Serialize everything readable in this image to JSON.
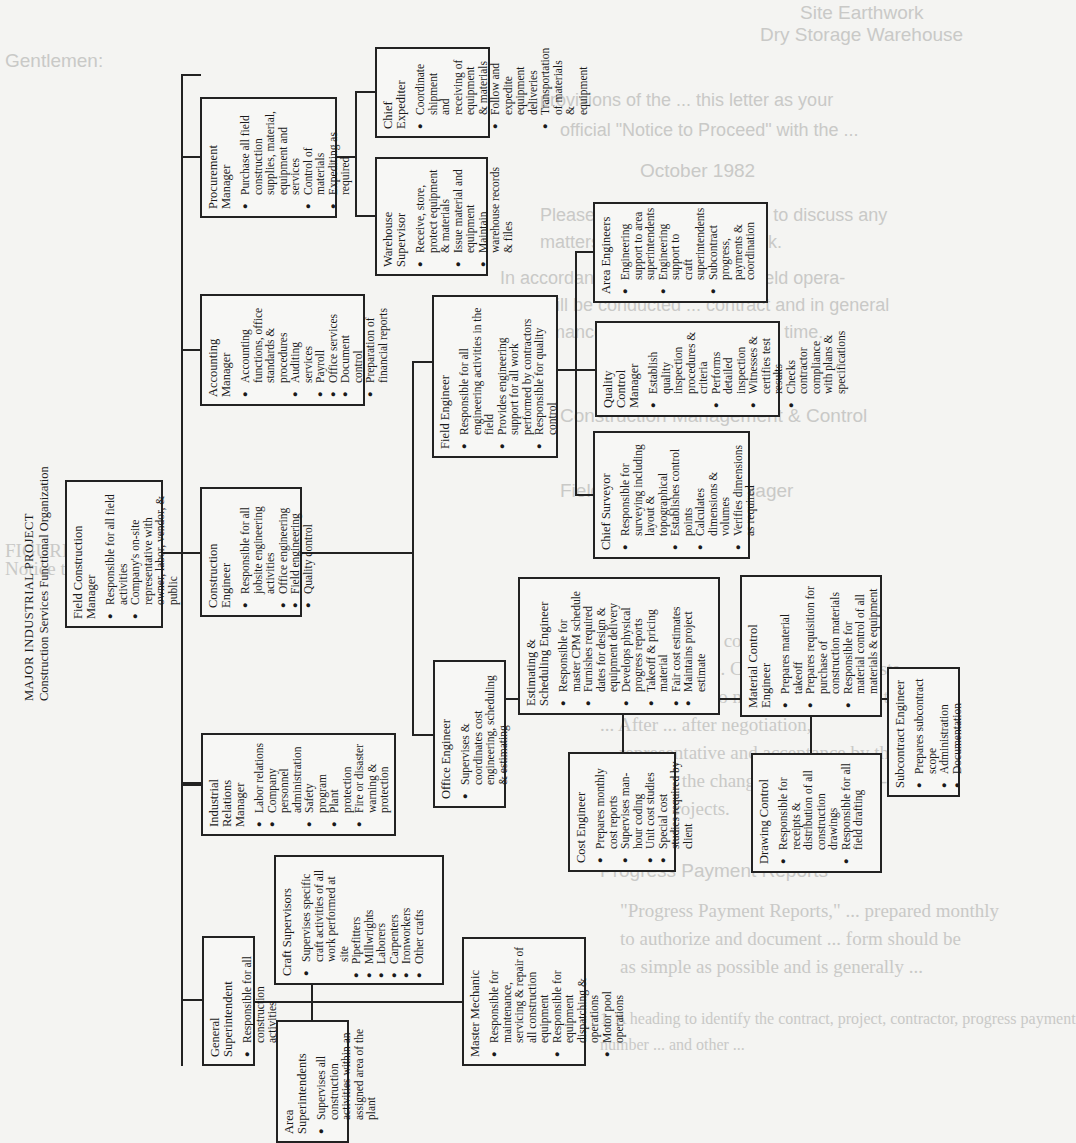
{
  "bleed_through": {
    "lines": [
      "Site Earthwork",
      "Dry Storage Warehouse",
      "Gentlemen:",
      "Pursuant to the provisions of the",
      "official \"Notice to Proceed\" with the",
      "October 1982",
      "Please feel free to contact me at any time to discuss any",
      "matters relating to the construction work.",
      "In accordance, the pre-award conference all field opera-",
      "tions will be conducted in accordance with the provisions of the contract and in general",
      "conformance to the Contractor's plans presented at that time.",
      "Very truly yours,",
      "Construction Management & Control",
      "D. Hanson",
      "Field Construction Manager",
      "FIGURE 7-7",
      "Notice to Proceed",
      "... includes a complete but concise description",
      "... schedule and price. Change order requests",
      "... representative, who normally compares them",
      "... After ... after negotiation,",
      "... representative and acceptance by the",
      "... execute the change order. Figure 7-8",
      "... for ... projects.",
      "Progress Payment Reports",
      "\"Progress Payment Reports,\" ... prepared monthly",
      "to authorize and document ... form should be",
      "as simple as possible and is generally ...",
      "1. A heading to identify the contract, project, contractor, progress payment",
      "number ... and other ..."
    ]
  },
  "chart": {
    "title": "MAJOR INDUSTRIAL PROJECT",
    "subtitle": "Construction Services Functional Organization",
    "boxes": {
      "field_construction_manager": {
        "title": "Field Construction Manager",
        "items": [
          "Responsible for all field activities",
          "Company's on-site representative with owner, labor, vendor, & public"
        ]
      },
      "construction_engineer": {
        "title": "Construction Engineer",
        "items": [
          "Responsible for all jobsite engineering activities",
          "Office engineering",
          "Field engineering",
          "Quality control"
        ]
      },
      "accounting_manager": {
        "title": "Accounting Manager",
        "items": [
          "Accounting functions, office standards & procedures",
          "Auditing services",
          "Payroll",
          "Office services",
          "Document control",
          "Preparation of financial reports"
        ]
      },
      "procurement_manager": {
        "title": "Procurement Manager",
        "items": [
          "Purchase all field construction supplies, material, equipment and services",
          "Control of materials",
          "Expediting as required"
        ]
      },
      "chief_expediter": {
        "title": "Chief Expediter",
        "items": [
          "Coordinate shipment and receiving of equipment & materials",
          "Follow and expedite equipment deliveries",
          "Transportation of materials & equipment"
        ]
      },
      "warehouse_supervisor": {
        "title": "Warehouse Supervisor",
        "items": [
          "Receive, store, protect equipment & materials",
          "Issue material and equipment",
          "Maintain warehouse records & files"
        ]
      },
      "field_engineer": {
        "title": "Field Engineer",
        "items": [
          "Responsible for all engineering activities in the field",
          "Provides engineering support for all work performed by contractors",
          "Responsible for quality control"
        ]
      },
      "area_engineers": {
        "title": "Area Engineers",
        "items": [
          "Engineering support to area superintendents",
          "Engineering support to craft superintendents",
          "Subcontract progress, payments & coordination"
        ]
      },
      "quality_control_manager": {
        "title": "Quality Control Manager",
        "items": [
          "Establish quality inspection procedures & criteria",
          "Performs detailed inspection",
          "Witnesses & certifies test results",
          "Checks contractor compliance with plans & specifications"
        ]
      },
      "chief_surveyor": {
        "title": "Chief Surveyor",
        "items": [
          "Responsible for surveying including layout & topographical",
          "Establishes control points",
          "Calculates dimensions & volumes",
          "Verifies dimensions as required"
        ]
      },
      "estimating_scheduling_engineer": {
        "title": "Estimating & Scheduling Engineer",
        "items": [
          "Responsible for master CPM schedule",
          "Furnishes required dates for design & equipment delivery",
          "Develops physical progress reports",
          "Takeoff & pricing material",
          "Fair cost estimates",
          "Maintains project estimate"
        ]
      },
      "material_control_engineer": {
        "title": "Material Control Engineer",
        "items": [
          "Prepares material takeoff",
          "Prepares requisition for purchase of construction materials",
          "Responsible for material control of all materials & equipment"
        ]
      },
      "office_engineer": {
        "title": "Office Engineer",
        "items": [
          "Supervises & coordinates cost engineering, scheduling & estimating"
        ]
      },
      "cost_engineer": {
        "title": "Cost Engineer",
        "items": [
          "Prepares monthly cost reports",
          "Supervises man-hour coding",
          "Unit cost studies",
          "Special cost studies required by client"
        ]
      },
      "drawing_control": {
        "title": "Drawing Control",
        "items": [
          "Responsible for receipts & distribution of all construction drawings",
          "Responsible for all field drafting"
        ]
      },
      "subcontract_engineer": {
        "title": "Subcontract Engineer",
        "items": [
          "Prepares subcontract scope",
          "Administration",
          "Documentation"
        ]
      },
      "industrial_relations_manager": {
        "title": "Industrial Relations Manager",
        "items": [
          "Labor relations",
          "Company personnel administration",
          "Safety program",
          "Plant protection",
          "Fire or disaster warning & protection"
        ]
      },
      "craft_supervisors": {
        "title": "Craft Supervisors",
        "items": [
          "Supervises specific craft activities of all work performed at site"
        ],
        "sub_items": [
          "Pipefitters",
          "Millwrights",
          "Laborers",
          "Carpenters",
          "Ironworkers",
          "Other crafts"
        ]
      },
      "general_superintendent": {
        "title": "General Superintendent",
        "items": [
          "Responsible for all construction activities"
        ]
      },
      "area_superintendents": {
        "title": "Area Superintendents",
        "items": [
          "Supervises all construction activities within an assigned area of the plant"
        ]
      },
      "master_mechanic": {
        "title": "Master Mechanic",
        "items": [
          "Responsible for maintenance, servicing & repair of all construction equipment",
          "Responsible for equipment dispatching & operations",
          "Motor pool operations"
        ]
      }
    }
  }
}
